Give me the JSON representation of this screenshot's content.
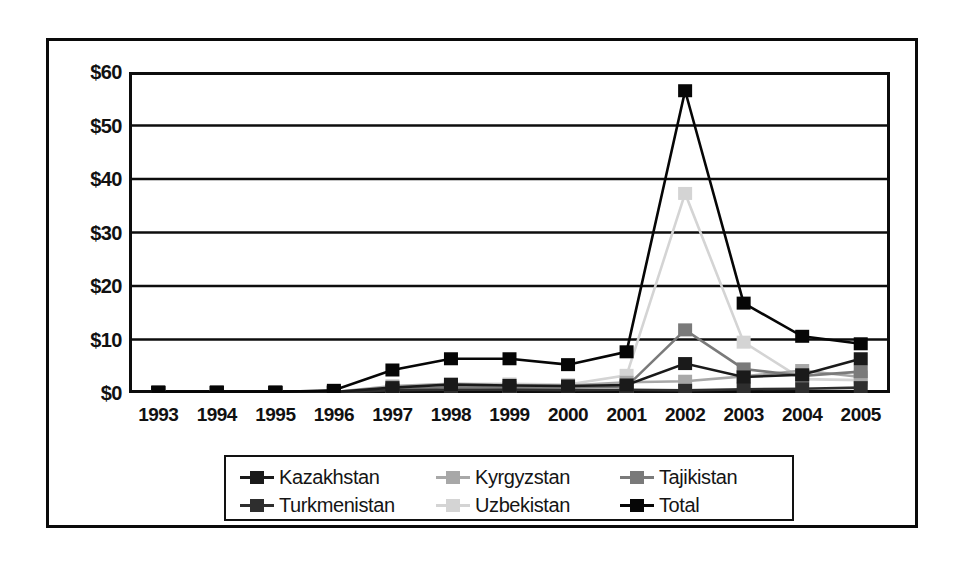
{
  "chart_data": {
    "type": "line",
    "title": "",
    "subtitle": "",
    "xlabel": "",
    "ylabel": "",
    "categories": [
      "1993",
      "1994",
      "1995",
      "1996",
      "1997",
      "1998",
      "1999",
      "2000",
      "2001",
      "2002",
      "2003",
      "2004",
      "2005"
    ],
    "ylim": [
      0,
      60
    ],
    "ytick_values": [
      0,
      10,
      20,
      30,
      40,
      50,
      60
    ],
    "ytick_labels": [
      "$0",
      "$10",
      "$20",
      "$30",
      "$40",
      "$50",
      "$60"
    ],
    "grid": true,
    "grid_axis": "y",
    "legend_position": "bottom",
    "marker": "square",
    "currency_unit": "$",
    "series": [
      {
        "name": "Kazakhstan",
        "color": "#1a1a1a",
        "values": [
          0.1,
          0.1,
          0.1,
          0.2,
          1.0,
          1.6,
          1.4,
          1.3,
          1.5,
          5.5,
          3.0,
          3.4,
          6.4
        ]
      },
      {
        "name": "Kyrgyzstan",
        "color": "#a8a8a8",
        "values": [
          0.1,
          0.1,
          0.1,
          0.2,
          1.3,
          1.7,
          1.5,
          1.4,
          2.0,
          2.2,
          3.1,
          4.2,
          3.0
        ]
      },
      {
        "name": "Tajikistan",
        "color": "#7a7a7a",
        "values": [
          0.1,
          0.1,
          0.1,
          0.2,
          0.7,
          1.1,
          1.0,
          1.0,
          1.2,
          11.8,
          4.5,
          3.2,
          4.0
        ]
      },
      {
        "name": "Turkmenistan",
        "color": "#2e2e2e",
        "values": [
          0.1,
          0.1,
          0.1,
          0.1,
          0.5,
          0.6,
          0.6,
          0.5,
          0.6,
          0.5,
          0.7,
          0.8,
          1.0
        ]
      },
      {
        "name": "Uzbekistan",
        "color": "#d4d4d4",
        "values": [
          0.1,
          0.1,
          0.1,
          0.2,
          1.1,
          1.7,
          1.7,
          1.6,
          3.3,
          37.3,
          9.5,
          2.6,
          2.4
        ]
      },
      {
        "name": "Total",
        "color": "#060606",
        "values": [
          0.2,
          0.2,
          0.2,
          0.5,
          4.3,
          6.4,
          6.4,
          5.3,
          7.7,
          56.5,
          16.8,
          10.6,
          9.2
        ]
      }
    ]
  },
  "axis": {
    "y_labels": [
      "$60",
      "$50",
      "$40",
      "$30",
      "$20",
      "$10",
      "$0"
    ],
    "x_labels": [
      "1993",
      "1994",
      "1995",
      "1996",
      "1997",
      "1998",
      "1999",
      "2000",
      "2001",
      "2002",
      "2003",
      "2004",
      "2005"
    ]
  },
  "legend": {
    "rows": [
      [
        {
          "label": "Kazakhstan",
          "color": "#1a1a1a"
        },
        {
          "label": "Kyrgyzstan",
          "color": "#a8a8a8"
        },
        {
          "label": "Tajikistan",
          "color": "#7a7a7a"
        }
      ],
      [
        {
          "label": "Turkmenistan",
          "color": "#2e2e2e"
        },
        {
          "label": "Uzbekistan",
          "color": "#d4d4d4"
        },
        {
          "label": "Total",
          "color": "#060606"
        }
      ]
    ]
  }
}
